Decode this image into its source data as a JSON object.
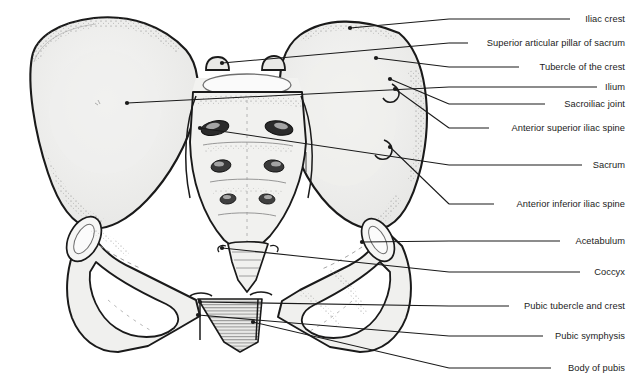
{
  "figure": {
    "background_color": "#ffffff",
    "bone_fill_color": "#f0f0ef",
    "bone_outline_color": "#1a1a1a",
    "leader_line_color": "#1a1a1a",
    "label_text_color": "#1c1c1c"
  },
  "labels": [
    {
      "id": "iliac-crest",
      "text": "Iliac crest",
      "y": 19,
      "line_start_x": 449,
      "line_end_x": 570,
      "target_x": 350,
      "target_y": 28
    },
    {
      "id": "superior-articular-pillar",
      "text": "Superior articular pillar of sacrum",
      "y": 43,
      "line_start_x": 449,
      "line_end_x": 468,
      "target_x": 222,
      "target_y": 63
    },
    {
      "id": "tubercle-of-the-crest",
      "text": "Tubercle of the crest",
      "y": 67,
      "line_start_x": 449,
      "line_end_x": 519,
      "target_x": 376,
      "target_y": 58
    },
    {
      "id": "ilium",
      "text": "Ilium",
      "y": 87,
      "line_start_x": 449,
      "line_end_x": 597,
      "target_x": 127,
      "target_y": 103
    },
    {
      "id": "sacroiliac-joint",
      "text": "Sacroiliac joint",
      "y": 104,
      "line_start_x": 449,
      "line_end_x": 545,
      "target_x": 390,
      "target_y": 79
    },
    {
      "id": "anterior-superior-iliac-spine",
      "text": "Anterior superior iliac spine",
      "y": 128,
      "line_start_x": 449,
      "line_end_x": 489,
      "target_x": 395,
      "target_y": 89
    },
    {
      "id": "sacrum",
      "text": "Sacrum",
      "y": 165,
      "line_start_x": 449,
      "line_end_x": 582,
      "target_x": 200,
      "target_y": 128
    },
    {
      "id": "anterior-inferior-iliac-spine",
      "text": "Anterior inferior iliac spine",
      "y": 204,
      "line_start_x": 449,
      "line_end_x": 494,
      "target_x": 390,
      "target_y": 147
    },
    {
      "id": "acetabulum",
      "text": "Acetabulum",
      "y": 241,
      "line_start_x": 449,
      "line_end_x": 560,
      "target_x": 362,
      "target_y": 242
    },
    {
      "id": "coccyx",
      "text": "Coccyx",
      "y": 272,
      "line_start_x": 449,
      "line_end_x": 580,
      "target_x": 222,
      "target_y": 248
    },
    {
      "id": "pubic-tubercle-and-crest",
      "text": "Pubic tubercle and crest",
      "y": 306,
      "line_start_x": 449,
      "line_end_x": 509,
      "target_x": 200,
      "target_y": 302
    },
    {
      "id": "pubic-symphysis",
      "text": "Pubic symphysis",
      "y": 336,
      "line_start_x": 449,
      "line_end_x": 543,
      "target_x": 198,
      "target_y": 315
    },
    {
      "id": "body-of-pubis",
      "text": "Body of pubis",
      "y": 368,
      "line_start_x": 449,
      "line_end_x": 551,
      "target_x": 253,
      "target_y": 322
    }
  ]
}
